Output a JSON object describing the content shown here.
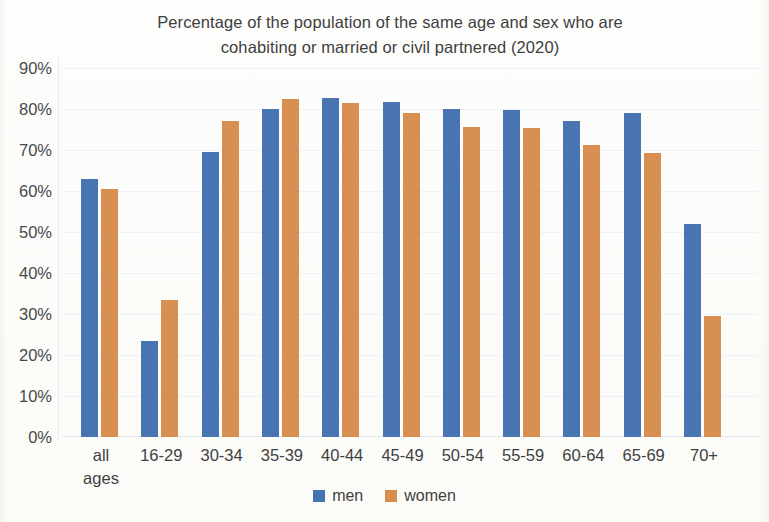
{
  "chart_data": {
    "type": "bar",
    "title": "Percentage of the population of the same age and sex who are cohabiting or married or civil partnered (2020)",
    "title_line1": "Percentage of the population of the same age and sex who are",
    "title_line2": "cohabiting or married or civil partnered (2020)",
    "xlabel": "",
    "ylabel": "",
    "ylim": [
      0,
      90
    ],
    "ytick_labels": [
      "90%",
      "80%",
      "70%",
      "60%",
      "50%",
      "40%",
      "30%",
      "20%",
      "10%",
      "0%"
    ],
    "ytick_values": [
      90,
      80,
      70,
      60,
      50,
      40,
      30,
      20,
      10,
      0
    ],
    "grid": true,
    "legend_position": "bottom",
    "categories": [
      "all ages",
      "16-29",
      "30-34",
      "35-39",
      "40-44",
      "45-49",
      "50-54",
      "55-59",
      "60-64",
      "65-69",
      "70+"
    ],
    "category_lines": [
      [
        "all",
        "ages"
      ],
      [
        "16-29",
        ""
      ],
      [
        "30-34",
        ""
      ],
      [
        "35-39",
        ""
      ],
      [
        "40-44",
        ""
      ],
      [
        "45-49",
        ""
      ],
      [
        "50-54",
        ""
      ],
      [
        "55-59",
        ""
      ],
      [
        "60-64",
        ""
      ],
      [
        "65-69",
        ""
      ],
      [
        "70+",
        ""
      ]
    ],
    "series": [
      {
        "name": "men",
        "color": "#4573b2",
        "values": [
          63.0,
          23.5,
          69.5,
          80.0,
          82.8,
          81.8,
          80.0,
          79.8,
          77.0,
          79.0,
          52.0
        ]
      },
      {
        "name": "women",
        "color": "#d98e4f",
        "values": [
          60.5,
          33.3,
          77.0,
          82.5,
          81.5,
          79.0,
          75.5,
          75.3,
          71.2,
          69.2,
          29.5
        ]
      }
    ]
  },
  "legend": {
    "items": [
      {
        "label": "men",
        "color": "#4573b2"
      },
      {
        "label": "women",
        "color": "#d98e4f"
      }
    ]
  }
}
